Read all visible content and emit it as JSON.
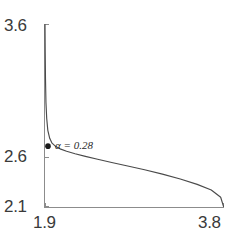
{
  "chart_data": {
    "type": "line",
    "title": "",
    "xlabel": "",
    "ylabel": "",
    "xlim": [
      1.9,
      3.8
    ],
    "ylim": [
      2.1,
      3.6
    ],
    "grid": false,
    "legend": null,
    "x_tick_labels": [
      "1.9",
      "3.8"
    ],
    "y_tick_labels": [
      "2.1",
      "2.6",
      "3.6"
    ],
    "x_ticks": [
      1.9,
      3.8
    ],
    "y_ticks": [
      2.1,
      2.6,
      3.6
    ],
    "series": [
      {
        "name": "l-curve",
        "x": [
          1.9,
          1.902,
          1.905,
          1.91,
          1.918,
          1.93,
          1.95,
          1.975,
          2.01,
          2.06,
          2.13,
          2.22,
          2.33,
          2.46,
          2.61,
          2.78,
          2.96,
          3.15,
          3.34,
          3.52,
          3.67,
          3.77,
          3.8
        ],
        "y": [
          3.6,
          3.38,
          3.16,
          2.96,
          2.83,
          2.73,
          2.665,
          2.625,
          2.6,
          2.578,
          2.558,
          2.538,
          2.516,
          2.492,
          2.466,
          2.437,
          2.406,
          2.37,
          2.33,
          2.286,
          2.24,
          2.18,
          2.105
        ]
      }
    ],
    "annotations": [
      {
        "text": "α = 0.28",
        "alpha_symbol": "α",
        "equals": "=",
        "value": "0.28",
        "point_x": 1.9,
        "point_y": 2.6,
        "marker": "filled-circle"
      }
    ],
    "colors": {
      "curve": "#4a4a4a",
      "axis": "#8c8c8c",
      "marker": "#1a1a1a",
      "tick_text": "#3a3a3a",
      "annotation_text": "#2b2b2b",
      "background": "#ffffff"
    }
  },
  "axes": {
    "y_max_label": "3.6",
    "y_mid_label": "2.6",
    "y_min_label": "2.1",
    "x_min_label": "1.9",
    "x_max_label": "3.8"
  },
  "annotation": {
    "alpha_text": "α = 0.28"
  }
}
